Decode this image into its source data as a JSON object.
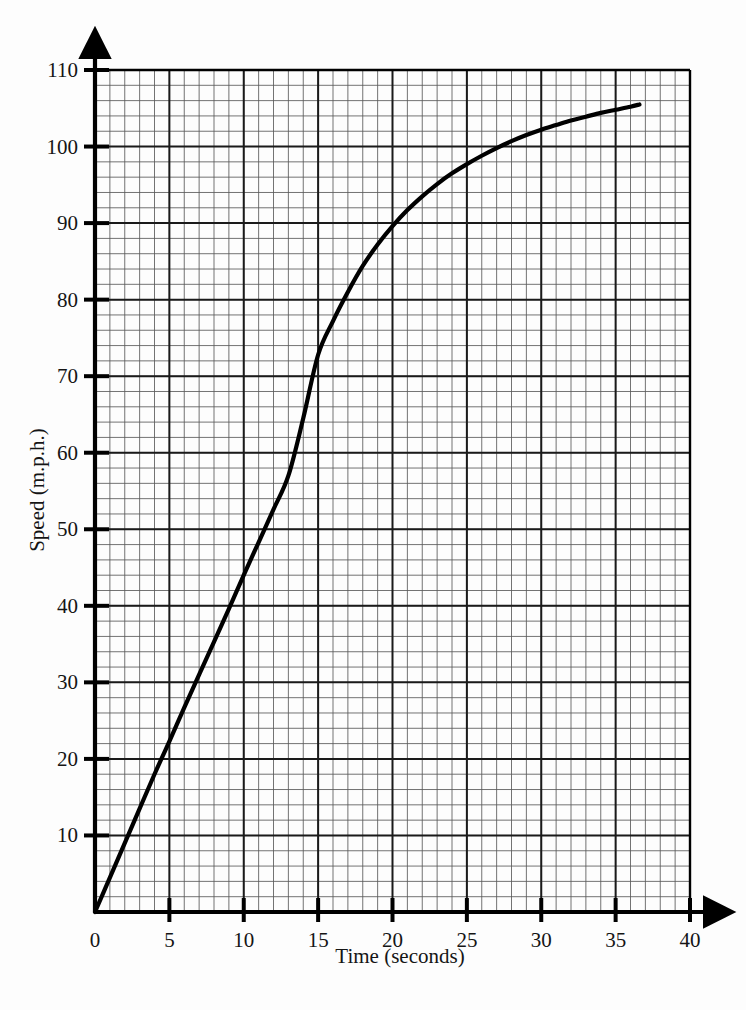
{
  "chart_data": {
    "type": "line",
    "title": "",
    "subtitle": "",
    "xlabel": "Time (seconds)",
    "ylabel": "Speed (m.p.h.)",
    "xlim": [
      0,
      40
    ],
    "ylim": [
      0,
      110
    ],
    "x_major_ticks": [
      0,
      5,
      10,
      15,
      20,
      25,
      30,
      35,
      40
    ],
    "x_tick_labels": [
      "0",
      "5",
      "10",
      "15",
      "20",
      "25",
      "30",
      "35",
      "40"
    ],
    "y_major_ticks": [
      10,
      20,
      30,
      40,
      50,
      60,
      70,
      80,
      90,
      100,
      110
    ],
    "y_tick_labels": [
      "10",
      "20",
      "30",
      "40",
      "50",
      "60",
      "70",
      "80",
      "90",
      "100",
      "110"
    ],
    "x_minor_step": 1,
    "y_minor_step": 2,
    "grid": true,
    "grid_style": "graph-paper",
    "legend": "none",
    "axis_arrows": true,
    "series": [
      {
        "name": "Speed",
        "color": "#000000",
        "x": [
          0,
          1,
          2,
          3,
          4,
          5,
          6,
          7,
          8,
          9,
          10,
          11,
          12,
          13,
          14,
          15,
          16,
          17,
          18,
          19,
          20,
          21,
          22,
          23,
          24,
          25,
          26,
          27,
          28,
          29,
          30,
          31,
          32,
          33,
          34,
          35,
          36,
          36.6
        ],
        "values": [
          0,
          4.5,
          9,
          13.5,
          18,
          22.3,
          26.7,
          31,
          35.3,
          39.6,
          44,
          48.3,
          52.6,
          57,
          64.5,
          72.8,
          77.2,
          81,
          84.4,
          87.2,
          89.6,
          91.7,
          93.5,
          95.1,
          96.5,
          97.7,
          98.8,
          99.8,
          100.7,
          101.5,
          102.2,
          102.8,
          103.4,
          103.9,
          104.4,
          104.8,
          105.2,
          105.5
        ]
      }
    ],
    "notable_points": [
      {
        "t": 0,
        "speed": 0
      },
      {
        "t": 5,
        "speed": 22
      },
      {
        "t": 10,
        "speed": 44
      },
      {
        "t": 15,
        "speed": 73
      },
      {
        "t": 20,
        "speed": 90
      },
      {
        "t": 25,
        "speed": 98
      },
      {
        "t": 30,
        "speed": 102
      },
      {
        "t": 36.6,
        "speed": 105.5
      }
    ]
  }
}
